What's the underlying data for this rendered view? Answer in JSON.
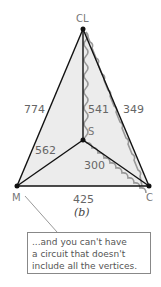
{
  "diagram": {
    "caption": "(b)",
    "vertices": [
      {
        "id": "CL",
        "label": "CL",
        "x": 83,
        "y": 29
      },
      {
        "id": "S",
        "label": "S",
        "x": 83,
        "y": 140
      },
      {
        "id": "M",
        "label": "M",
        "x": 17,
        "y": 186
      },
      {
        "id": "C",
        "label": "C",
        "x": 149,
        "y": 186
      }
    ],
    "edges": [
      {
        "from": "CL",
        "to": "M",
        "weight": "774"
      },
      {
        "from": "CL",
        "to": "S",
        "weight": "541"
      },
      {
        "from": "CL",
        "to": "C",
        "weight": "349"
      },
      {
        "from": "M",
        "to": "S",
        "weight": "562"
      },
      {
        "from": "S",
        "to": "C",
        "weight": "300"
      },
      {
        "from": "M",
        "to": "C",
        "weight": "425"
      }
    ],
    "highlighted_circuit": [
      "CL",
      "S",
      "C",
      "CL"
    ],
    "callout": {
      "points_to": "M",
      "lines": [
        "...and you can't have",
        "a circuit that doesn't",
        "include all the vertices."
      ]
    }
  }
}
